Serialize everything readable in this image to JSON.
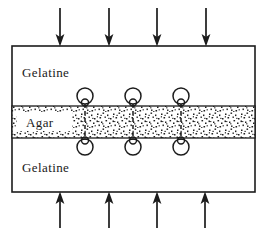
{
  "figure": {
    "background_color": "#ffffff",
    "ink_color": "#1c1c1c",
    "width": 264,
    "height": 235
  },
  "specimen": {
    "outline": {
      "x": 12,
      "y": 46,
      "width": 243,
      "height": 146
    },
    "layers": [
      {
        "id": "top-gelatine",
        "label": "Gelatine",
        "material": "gelatine",
        "fill": "#ffffff",
        "label_x": 22,
        "label_y": 77
      },
      {
        "id": "agar-band",
        "label": "Agar",
        "material": "agar",
        "fill": "stipple",
        "band": {
          "x": 12,
          "y": 106,
          "width": 243,
          "height": 32
        },
        "label_x": 26,
        "label_y": 127,
        "label_plate": {
          "x": 17,
          "y": 112,
          "width": 55,
          "height": 19
        }
      },
      {
        "id": "bottom-gelatine",
        "label": "Gelatine",
        "material": "gelatine",
        "fill": "#ffffff",
        "label_x": 22,
        "label_y": 172
      }
    ]
  },
  "loads": {
    "top_arrows": {
      "direction": "down",
      "count": 4,
      "x_positions": [
        60,
        109,
        157,
        206
      ],
      "tail_y": 8,
      "head_y": 46
    },
    "bottom_arrows": {
      "direction": "up",
      "count": 4,
      "x_positions": [
        60,
        109,
        157,
        205
      ],
      "tail_y": 228,
      "head_y": 192
    }
  },
  "interface_features": {
    "description": "Interfacial crack loops at the gelatine-agar boundaries",
    "x_positions": [
      85,
      133,
      181
    ],
    "top_loops": {
      "side": "upper-interface",
      "outer_cy": 96,
      "outer_r": 8,
      "inner_cy": 102.5,
      "inner_r": 3.5
    },
    "bottom_loops": {
      "side": "lower-interface",
      "outer_cy": 147,
      "outer_r": 8,
      "inner_cy": 140.5,
      "inner_r": 3.5
    },
    "crack_lines": {
      "from_y": 104,
      "to_y": 140
    }
  }
}
